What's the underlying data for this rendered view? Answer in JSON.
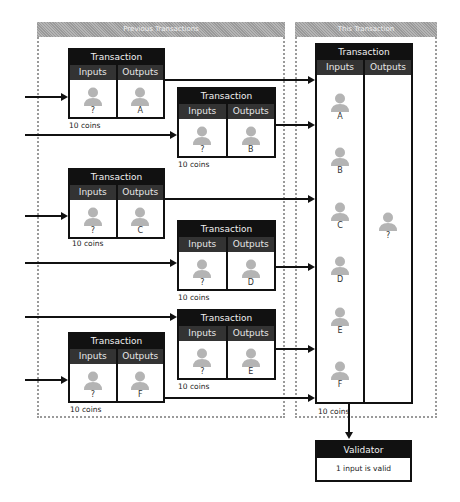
{
  "groups": {
    "previous": {
      "label": "Previous Transactions"
    },
    "current": {
      "label": "This Transaction"
    }
  },
  "tx_labels": {
    "title": "Transaction",
    "inputs": "Inputs",
    "outputs": "Outputs"
  },
  "person_icon": "person-silhouette-icon",
  "colors": {
    "header": "#111111",
    "subheader": "#333333",
    "person": "#b4b4b4",
    "dotted_border": "#9a9a9a"
  },
  "previous_transactions": [
    {
      "id": "A",
      "input": "?",
      "output": "A",
      "coins": "10 coins"
    },
    {
      "id": "B",
      "input": "?",
      "output": "B",
      "coins": "10 coins"
    },
    {
      "id": "C",
      "input": "?",
      "output": "C",
      "coins": "10 coins"
    },
    {
      "id": "D",
      "input": "?",
      "output": "D",
      "coins": "10 coins"
    },
    {
      "id": "E",
      "input": "?",
      "output": "E",
      "coins": "10 coins"
    },
    {
      "id": "F",
      "input": "?",
      "output": "F",
      "coins": "10 coins"
    }
  ],
  "this_transaction": {
    "inputs": [
      "A",
      "B",
      "C",
      "D",
      "E",
      "F"
    ],
    "output": "?",
    "coins": "10 coins"
  },
  "validator": {
    "title": "Validator",
    "result": "1 input is valid"
  }
}
